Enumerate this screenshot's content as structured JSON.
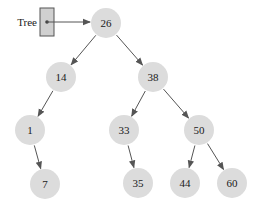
{
  "diagram": {
    "pointer": {
      "label": "Tree",
      "box": {
        "x": 40,
        "y": 8,
        "w": 14,
        "h": 28
      },
      "dot": {
        "x": 47,
        "y": 22
      },
      "target": "26"
    },
    "colors": {
      "node_fill": "#dcdcdc",
      "edge": "#555555",
      "box_fill": "#d0d0d0",
      "box_stroke": "#555555",
      "text": "#1a1a1a"
    },
    "node_radius": 15,
    "nodes": [
      {
        "id": "26",
        "label": "26",
        "x": 106,
        "y": 23
      },
      {
        "id": "14",
        "label": "14",
        "x": 61,
        "y": 77
      },
      {
        "id": "38",
        "label": "38",
        "x": 153,
        "y": 77
      },
      {
        "id": "1",
        "label": "1",
        "x": 30,
        "y": 130
      },
      {
        "id": "33",
        "label": "33",
        "x": 124,
        "y": 130
      },
      {
        "id": "50",
        "label": "50",
        "x": 199,
        "y": 130
      },
      {
        "id": "7",
        "label": "7",
        "x": 45,
        "y": 184
      },
      {
        "id": "35",
        "label": "35",
        "x": 138,
        "y": 183
      },
      {
        "id": "44",
        "label": "44",
        "x": 185,
        "y": 183
      },
      {
        "id": "60",
        "label": "60",
        "x": 232,
        "y": 183
      }
    ],
    "edges": [
      {
        "from": "26",
        "to": "14"
      },
      {
        "from": "26",
        "to": "38"
      },
      {
        "from": "14",
        "to": "1"
      },
      {
        "from": "38",
        "to": "33"
      },
      {
        "from": "38",
        "to": "50"
      },
      {
        "from": "1",
        "to": "7"
      },
      {
        "from": "33",
        "to": "35"
      },
      {
        "from": "50",
        "to": "44"
      },
      {
        "from": "50",
        "to": "60"
      }
    ]
  }
}
